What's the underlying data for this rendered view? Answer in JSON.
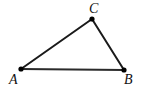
{
  "figure": {
    "type": "geometry-diagram",
    "canvas": {
      "width": 141,
      "height": 93,
      "background": "#ffffff"
    },
    "style": {
      "stroke_color": "#1a1a1a",
      "vertex_dot_color": "#000000",
      "label_color": "#111111",
      "side_stroke_width": 2,
      "base_stroke_width": 1.8,
      "vertex_dot_radius": 2.6
    },
    "vertices": [
      {
        "name": "A",
        "label": "A",
        "x": 21,
        "y": 69,
        "label_x": 9,
        "label_y": 73,
        "label_position": "below-left"
      },
      {
        "name": "B",
        "label": "B",
        "x": 124,
        "y": 70,
        "label_x": 124,
        "label_y": 73,
        "label_position": "below-right"
      },
      {
        "name": "C",
        "label": "C",
        "x": 92,
        "y": 19,
        "label_x": 89,
        "label_y": 2,
        "label_position": "above"
      }
    ],
    "edges": [
      {
        "name": "AB",
        "from": "A",
        "to": "B",
        "x1": 21,
        "y1": 69,
        "x2": 124,
        "y2": 70
      },
      {
        "name": "AC",
        "from": "A",
        "to": "C",
        "x1": 21,
        "y1": 69,
        "x2": 92,
        "y2": 19
      },
      {
        "name": "BC",
        "from": "B",
        "to": "C",
        "x1": 124,
        "y1": 70,
        "x2": 92,
        "y2": 19
      }
    ]
  }
}
